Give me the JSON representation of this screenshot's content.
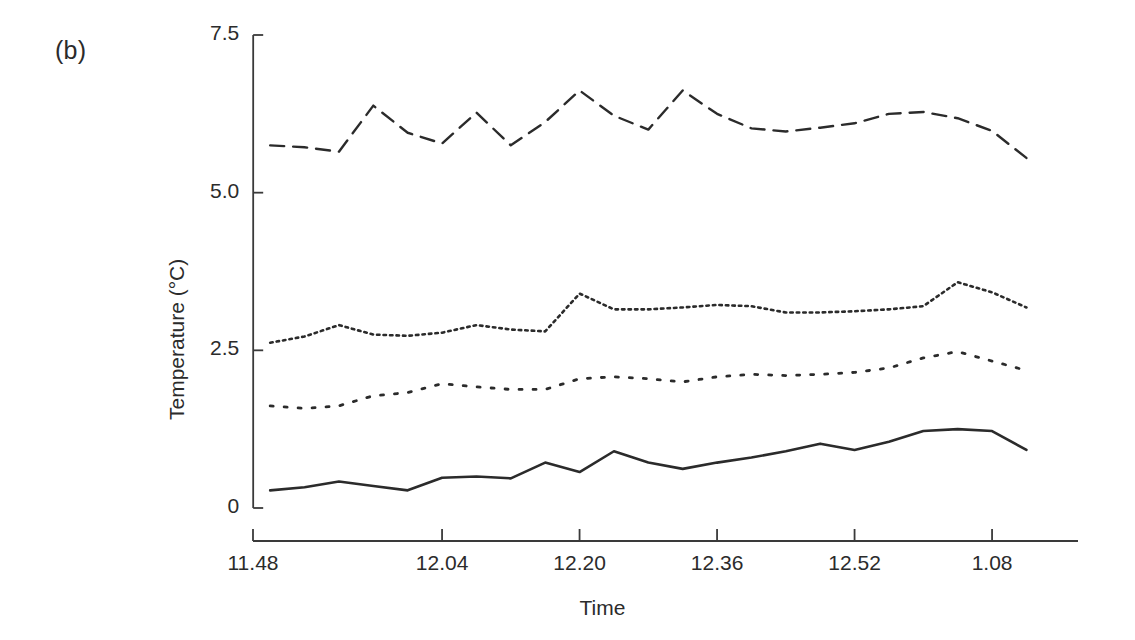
{
  "figure": {
    "panel_label": "(b)",
    "y_axis_title": "Temperature (°C)",
    "x_axis_title": "Time"
  },
  "chart_data": {
    "type": "line",
    "title": "",
    "subtitle": "",
    "panel": "(b)",
    "xlabel": "Time",
    "ylabel": "Temperature (°C)",
    "grid": false,
    "legend": "none",
    "ylim": [
      0,
      7.5
    ],
    "ytick_labels": [
      "0",
      "2.5",
      "5.0",
      "7.5"
    ],
    "yticks": [
      0,
      2.5,
      5.0,
      7.5
    ],
    "xtick_labels": [
      "11.48",
      "12.04",
      "12.20",
      "12.36",
      "12.52",
      "1.08"
    ],
    "xticks": [
      708,
      724,
      740,
      756,
      772,
      788
    ],
    "xlim": [
      702,
      798
    ],
    "x_minutes": [
      704,
      708,
      712,
      716,
      720,
      724,
      728,
      732,
      736,
      740,
      744,
      748,
      752,
      756,
      760,
      764,
      768,
      772,
      776,
      780,
      784,
      788,
      792
    ],
    "series": [
      {
        "name": "series-1-dashed",
        "style": "dashed",
        "dash": "14,9",
        "color": "#2b2b2b",
        "width": 2.4,
        "values": [
          5.75,
          5.72,
          5.65,
          6.38,
          5.95,
          5.78,
          6.27,
          5.75,
          6.12,
          6.62,
          6.22,
          6.0,
          6.62,
          6.25,
          6.02,
          5.97,
          6.03,
          6.1,
          6.25,
          6.28,
          6.18,
          5.98,
          5.55
        ]
      },
      {
        "name": "series-2-fine-dotted",
        "style": "fine-dotted",
        "dash": "2.5,4",
        "color": "#2b2b2b",
        "width": 2.6,
        "values": [
          2.62,
          2.72,
          2.9,
          2.75,
          2.73,
          2.78,
          2.9,
          2.83,
          2.8,
          3.4,
          3.15,
          3.15,
          3.18,
          3.22,
          3.2,
          3.1,
          3.1,
          3.12,
          3.15,
          3.2,
          3.58,
          3.42,
          3.18
        ]
      },
      {
        "name": "series-3-coarse-dotted",
        "style": "coarse-dotted",
        "dash": "3,11",
        "color": "#2b2b2b",
        "width": 2.8,
        "values": [
          1.62,
          1.58,
          1.62,
          1.78,
          1.83,
          1.97,
          1.92,
          1.88,
          1.88,
          2.05,
          2.08,
          2.05,
          2.0,
          2.08,
          2.12,
          2.1,
          2.12,
          2.15,
          2.22,
          2.38,
          2.48,
          2.33,
          2.18
        ]
      },
      {
        "name": "series-4-solid",
        "style": "solid",
        "dash": "",
        "color": "#2b2b2b",
        "width": 2.6,
        "values": [
          0.28,
          0.33,
          0.42,
          0.35,
          0.28,
          0.48,
          0.5,
          0.47,
          0.72,
          0.57,
          0.9,
          0.72,
          0.62,
          0.72,
          0.8,
          0.9,
          1.02,
          0.92,
          1.05,
          1.22,
          1.25,
          1.22,
          0.92
        ]
      }
    ]
  },
  "axes": {
    "y_ticks": [
      {
        "label": "7.5",
        "value": 7.5
      },
      {
        "label": "5.0",
        "value": 5.0
      },
      {
        "label": "2.5",
        "value": 2.5
      },
      {
        "label": "0",
        "value": 0
      }
    ],
    "x_ticks": [
      {
        "label": "11.48",
        "value": 708
      },
      {
        "label": "12.04",
        "value": 724
      },
      {
        "label": "12.20",
        "value": 740
      },
      {
        "label": "12.36",
        "value": 756
      },
      {
        "label": "12.52",
        "value": 772
      },
      {
        "label": "1.08",
        "value": 788
      }
    ]
  }
}
